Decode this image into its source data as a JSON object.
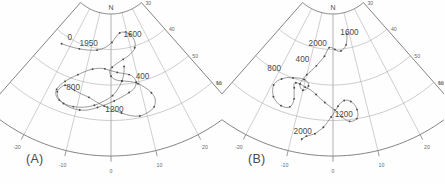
{
  "figure": {
    "type": "two-panel-polar-declination-inclination",
    "background": "#fefefe",
    "line_color": "#5e5e5e"
  },
  "panels": [
    {
      "id": "A",
      "label": "(A)",
      "cardinal_label": "N",
      "axes": {
        "dec": {
          "name": "Dec",
          "ticks": [
            "-30",
            "-20",
            "-10",
            "0",
            "10",
            "20",
            "30"
          ],
          "tick_values": [
            -30,
            -20,
            -10,
            0,
            10,
            20,
            30
          ],
          "range": [
            -30,
            30
          ],
          "unit": "degrees"
        },
        "inc": {
          "name": "Inc",
          "ticks": [
            "30",
            "40",
            "50",
            "60",
            "70"
          ],
          "tick_values": [
            30,
            40,
            50,
            60,
            70
          ],
          "range": [
            30,
            70
          ],
          "unit": "degrees"
        }
      },
      "date_labels": [
        {
          "text": "0",
          "dec": -21.5,
          "inc": 40.5
        },
        {
          "text": "1950",
          "dec": -11.5,
          "inc": 40.0
        },
        {
          "text": "1600",
          "dec": 12.5,
          "inc": 37.5
        },
        {
          "text": "400",
          "dec": 11.5,
          "inc": 49.5
        },
        {
          "text": "800",
          "dec": -12.5,
          "inc": 53.0
        },
        {
          "text": "1200",
          "dec": 1.0,
          "inc": 57.5
        }
      ],
      "chart_data": {
        "type": "line",
        "title": "",
        "xlabel": "Dec",
        "ylabel": "Inc",
        "xlim": [
          -30,
          30
        ],
        "ylim": [
          30,
          70
        ],
        "grid": true,
        "series": [
          {
            "name": "secular variation path A",
            "dec": [
              -24.0,
              -20.0,
              -15.5,
              -11.0,
              -7.0,
              -3.0,
              0.5,
              3.0,
              5.5,
              8.5,
              11.5,
              13.0,
              12.0,
              9.0,
              5.5,
              2.5,
              0.5,
              -0.5,
              0.0,
              1.5,
              4.0,
              7.0,
              9.5,
              11.5,
              13.0,
              13.5,
              12.5,
              10.5,
              8.0,
              5.5,
              3.0,
              0.5,
              -2.0,
              -4.5,
              -7.0,
              -9.5,
              -12.0,
              -14.0,
              -15.5,
              -16.5,
              -17.0,
              -16.0,
              -14.0,
              -11.5,
              -9.0,
              -6.5,
              -4.0,
              -1.5,
              1.0,
              3.5,
              6.0,
              8.0,
              9.0,
              8.5,
              7.0,
              5.0,
              2.5,
              0.0,
              -2.5,
              -5.0,
              -7.5,
              -10.0,
              -12.5,
              -14.5,
              -16.0,
              -17.0,
              -17.5,
              -17.0,
              -15.5,
              -13.5,
              -11.0,
              -8.0,
              -5.0,
              -2.0,
              0.5,
              2.5,
              4.0,
              5.0,
              5.5
            ],
            "inc": [
              42.5,
              42.0,
              41.5,
              41.0,
              40.5,
              39.5,
              38.0,
              36.5,
              35.5,
              35.5,
              36.5,
              38.5,
              40.5,
              42.0,
              43.0,
              44.0,
              45.0,
              46.0,
              47.5,
              48.5,
              49.0,
              49.5,
              50.5,
              52.0,
              54.0,
              56.0,
              58.0,
              59.0,
              59.5,
              59.0,
              58.0,
              57.0,
              56.0,
              55.0,
              54.0,
              53.5,
              53.0,
              52.5,
              52.5,
              53.5,
              55.0,
              56.5,
              57.5,
              58.0,
              58.0,
              57.5,
              56.5,
              55.5,
              54.5,
              53.5,
              52.5,
              51.5,
              50.0,
              48.5,
              47.5,
              47.0,
              46.5,
              46.0,
              45.5,
              45.5,
              46.0,
              47.0,
              48.5,
              50.0,
              51.5,
              53.0,
              54.5,
              56.0,
              57.0,
              57.5,
              57.5,
              57.0,
              56.0,
              54.5,
              53.0,
              51.0,
              49.0,
              47.0,
              45.0,
              43.0
            ]
          }
        ]
      }
    },
    {
      "id": "B",
      "label": "(B)",
      "cardinal_label": "N",
      "axes": {
        "dec": {
          "name": "Dec",
          "ticks": [
            "-30",
            "-20",
            "-10",
            "0",
            "10",
            "20",
            "30"
          ],
          "tick_values": [
            -30,
            -20,
            -10,
            0,
            10,
            20,
            30
          ],
          "range": [
            -30,
            30
          ],
          "unit": "degrees"
        },
        "inc": {
          "name": "Inc",
          "ticks": [
            "30",
            "40",
            "50",
            "60",
            "70"
          ],
          "tick_values": [
            30,
            40,
            50,
            60,
            70
          ],
          "range": [
            30,
            70
          ],
          "unit": "degrees"
        }
      },
      "date_labels": [
        {
          "text": "2000",
          "dec": -8.0,
          "inc": 39.5
        },
        {
          "text": "1600",
          "dec": 10.0,
          "inc": 36.5
        },
        {
          "text": "400",
          "dec": -13.0,
          "inc": 45.0
        },
        {
          "text": "800",
          "dec": -21.5,
          "inc": 50.5
        },
        {
          "text": "1200",
          "dec": 3.0,
          "inc": 59.0
        },
        {
          "text": "2000",
          "dec": -7.5,
          "inc": 64.5
        }
      ],
      "chart_data": {
        "type": "line",
        "title": "",
        "xlabel": "Dec",
        "ylabel": "Inc",
        "xlim": [
          -30,
          30
        ],
        "ylim": [
          30,
          70
        ],
        "grid": true,
        "series": [
          {
            "name": "secular variation path B",
            "dec": [
              8.5,
              8.0,
              7.0,
              5.5,
              4.0,
              2.5,
              1.0,
              -0.5,
              -2.0,
              -3.0,
              -4.0,
              -5.5,
              -7.0,
              -8.5,
              -10.0,
              -11.0,
              -11.5,
              -11.0,
              -10.0,
              -9.0,
              -8.5,
              -9.0,
              -10.5,
              -12.5,
              -14.5,
              -16.5,
              -18.0,
              -19.0,
              -19.5,
              -19.0,
              -18.0,
              -16.5,
              -15.0,
              -13.5,
              -12.5,
              -12.0,
              -12.0,
              -12.5,
              -13.0,
              -13.5,
              -13.0,
              -11.5,
              -9.5,
              -7.5,
              -5.5,
              -4.0,
              -2.5,
              -1.0,
              0.5,
              1.5,
              2.5,
              3.5,
              4.5,
              5.5,
              6.5,
              7.0,
              7.0,
              6.5,
              5.5,
              4.5,
              3.5,
              2.5,
              1.5,
              0.5,
              -0.5,
              -1.5,
              -2.5,
              -3.5,
              -4.5,
              -5.5,
              -6.5,
              -7.0,
              -7.5,
              -7.5
            ],
            "inc": [
              36.0,
              37.5,
              39.0,
              40.0,
              40.5,
              40.5,
              40.0,
              39.5,
              39.5,
              40.5,
              42.0,
              43.5,
              45.0,
              46.5,
              48.0,
              49.5,
              51.0,
              52.0,
              52.5,
              52.0,
              51.0,
              50.0,
              49.5,
              49.5,
              50.0,
              50.5,
              51.5,
              52.5,
              54.0,
              55.5,
              57.0,
              58.0,
              58.5,
              58.5,
              58.0,
              57.0,
              55.5,
              54.0,
              52.5,
              51.5,
              51.0,
              51.0,
              51.5,
              52.0,
              53.0,
              54.0,
              55.0,
              56.0,
              57.0,
              58.0,
              59.0,
              60.0,
              60.5,
              60.5,
              60.0,
              59.0,
              57.5,
              56.0,
              55.0,
              54.5,
              54.5,
              55.0,
              56.0,
              57.5,
              59.0,
              60.5,
              62.0,
              63.0,
              64.0,
              64.5,
              65.0,
              65.5,
              66.0,
              66.5
            ]
          }
        ]
      }
    }
  ]
}
